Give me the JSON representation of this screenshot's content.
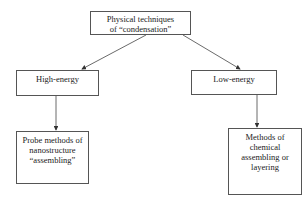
{
  "diagram": {
    "root": {
      "lines": [
        "Physical techniques",
        "of “condensation”"
      ]
    },
    "left": {
      "label": "High-energy",
      "child": {
        "lines": [
          "Probe methods of",
          "nanostructure",
          "“assembling”"
        ]
      }
    },
    "right": {
      "label": "Low-energy",
      "child": {
        "lines": [
          "Methods of",
          "chemical",
          "assembling or",
          "layering"
        ]
      }
    },
    "edges": [
      {
        "from": "root",
        "to": "left"
      },
      {
        "from": "root",
        "to": "right"
      },
      {
        "from": "left",
        "to": "left-child"
      },
      {
        "from": "right",
        "to": "right-child"
      }
    ]
  }
}
